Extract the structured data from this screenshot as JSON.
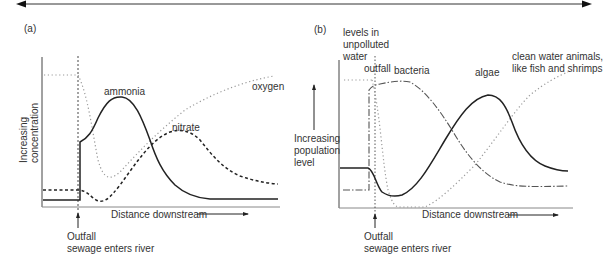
{
  "top_arrow": {
    "direction": "bidirectional"
  },
  "panel_a": {
    "label": "(a)",
    "y_axis_label_line1": "Increasing",
    "y_axis_label_line2": "concentration",
    "x_axis_label": "Distance downstream",
    "outfall_label": "Outfall",
    "outfall_sublabel": "sewage enters river",
    "series": [
      {
        "name": "ammonia",
        "style": "solid"
      },
      {
        "name": "nitrate",
        "style": "dashed"
      },
      {
        "name": "oxygen",
        "style": "dotted"
      }
    ]
  },
  "panel_b": {
    "label": "(b)",
    "unpolluted_label_line1": "levels in",
    "unpolluted_label_line2": "unpolluted",
    "unpolluted_label_line3": "water",
    "outfall_marker_label": "outfall",
    "y_axis_label_line1": "Increasing",
    "y_axis_label_line2": "population",
    "y_axis_label_line3": "level",
    "x_axis_label": "Distance downstream",
    "outfall_label": "Outfall",
    "outfall_sublabel": "sewage enters river",
    "series": [
      {
        "name": "bacteria",
        "style": "dash-dot"
      },
      {
        "name": "algae",
        "style": "solid"
      },
      {
        "name": "clean water animals, like fish and shrimps",
        "style": "dotted"
      }
    ],
    "clean_label_line1": "clean water animals,",
    "clean_label_line2": "like fish and shrimps"
  }
}
